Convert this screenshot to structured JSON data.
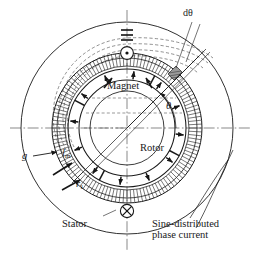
{
  "figure": {
    "kind": "motor-cross-section-diagram",
    "title_visible": false,
    "center": {
      "x": 127,
      "y": 128
    },
    "labels": {
      "d_theta": "dθ",
      "magnet": "Magnet",
      "rotor": "Rotor",
      "stator": "Stator",
      "theta": "θ",
      "airgap_g": "g",
      "magnet_length": "l",
      "magnet_length_sub": "m",
      "radius_r": "r",
      "radius_r_sub": "1",
      "sine_line1": "Sine-distributed",
      "sine_line2": "phase current"
    },
    "symbols": {
      "current_out_of_page": "dot-in-circle-icon",
      "current_into_page": "cross-in-circle-icon"
    },
    "geometry": {
      "stator_outer_radius": 106,
      "stator_back_radius": 75,
      "stator_bore_radius": 70,
      "airgap_outer_radius": 62,
      "magnet_outer_radius": 59,
      "magnet_inner_radius": 48,
      "rotor_core_radius": 37,
      "stator_slot_count": 120,
      "magnet_pole_count": 4,
      "magnetization_arrow_count": 12,
      "theta_angle_deg": 58
    },
    "colors": {
      "line": "#1a1a1a",
      "hatch": "#262626",
      "dashed_flux": "#555555",
      "background": "#ffffff"
    }
  }
}
